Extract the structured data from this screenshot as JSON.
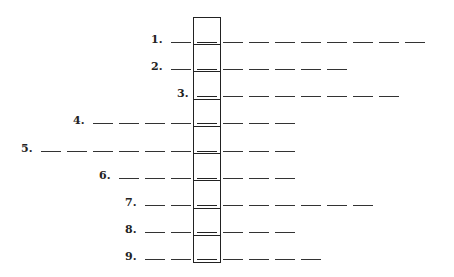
{
  "puzzle": {
    "type": "word-column-puzzle",
    "column": {
      "x": 193,
      "top": 17,
      "bottom": 262,
      "cell_count": 9
    },
    "blank_pitch": 26,
    "blank_width": 20,
    "rows": [
      {
        "label": "1.",
        "y": 42,
        "left_blanks": 1,
        "right_blanks": 8
      },
      {
        "label": "2.",
        "y": 69,
        "left_blanks": 1,
        "right_blanks": 5
      },
      {
        "label": "3.",
        "y": 96,
        "left_blanks": 0,
        "right_blanks": 7
      },
      {
        "label": "4.",
        "y": 123,
        "left_blanks": 4,
        "right_blanks": 3
      },
      {
        "label": "5.",
        "y": 151,
        "left_blanks": 6,
        "right_blanks": 3
      },
      {
        "label": "6.",
        "y": 178,
        "left_blanks": 3,
        "right_blanks": 3
      },
      {
        "label": "7.",
        "y": 205,
        "left_blanks": 2,
        "right_blanks": 6
      },
      {
        "label": "8.",
        "y": 232,
        "left_blanks": 2,
        "right_blanks": 3
      },
      {
        "label": "9.",
        "y": 259,
        "left_blanks": 2,
        "right_blanks": 4
      }
    ]
  },
  "colors": {
    "ink": "#222222",
    "background": "#ffffff"
  }
}
